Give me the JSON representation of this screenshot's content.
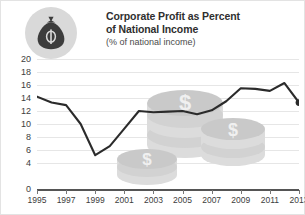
{
  "header": {
    "icon": "money-bag-icon",
    "title": "Corporate Profit as Percent of National Income",
    "title_line1": "Corporate Profit as Percent",
    "title_line2": "of National Income",
    "subtitle": "(% of national income)"
  },
  "colors": {
    "line": "#2b2b2b",
    "grid": "#e6e6e6",
    "axis": "#555555",
    "text": "#3d3d3d",
    "badge_background": "#d9d9d9",
    "icon": "#3c3c3c",
    "watermark": "#dcdcdc"
  },
  "watermark": {
    "name": "coin-stacks-watermark",
    "symbol": "$",
    "stacks": 3
  },
  "chart_data": {
    "type": "line",
    "title": "Corporate Profit as Percent of National Income",
    "subtitle": "(% of national income)",
    "xlabel": "",
    "ylabel": "",
    "ylim": [
      0,
      20
    ],
    "ytick_labels": [
      "20",
      "18",
      "16",
      "14",
      "12",
      "10",
      "8",
      "6",
      "4",
      "0"
    ],
    "ytick_values": [
      20,
      18,
      16,
      14,
      12,
      10,
      8,
      6,
      4,
      0
    ],
    "xtick_labels": [
      "1995",
      "1997",
      "1999",
      "2001",
      "2003",
      "2005",
      "2007",
      "2009",
      "2011",
      "2013"
    ],
    "xtick_values": [
      1995,
      1997,
      1999,
      2001,
      2003,
      2005,
      2007,
      2009,
      2011,
      2013
    ],
    "xlim": [
      1995,
      2013
    ],
    "grid": true,
    "legend": false,
    "end_marker": true,
    "x": [
      1995,
      1996,
      1997,
      1998,
      1999,
      2000,
      2001,
      2002,
      2003,
      2004,
      2005,
      2006,
      2007,
      2008,
      2009,
      2010,
      2011,
      2012,
      2013
    ],
    "values": [
      14.2,
      13.3,
      12.9,
      10.0,
      5.2,
      6.6,
      9.3,
      12.0,
      11.8,
      11.9,
      12.0,
      11.5,
      12.1,
      13.5,
      15.5,
      15.4,
      15.1,
      16.3,
      13.3
    ],
    "series": [
      {
        "name": "Corporate Profit as Percent of National Income",
        "values": [
          14.2,
          13.3,
          12.9,
          10.0,
          5.2,
          6.6,
          9.3,
          12.0,
          11.8,
          11.9,
          12.0,
          11.5,
          12.1,
          13.5,
          15.5,
          15.4,
          15.1,
          16.3,
          13.3
        ]
      }
    ]
  }
}
